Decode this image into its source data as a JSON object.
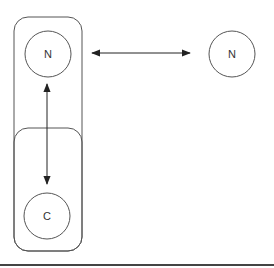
{
  "diagram": {
    "type": "graphical-model",
    "nodes": [
      {
        "id": "n-left",
        "label": "N",
        "group": "plate-outer"
      },
      {
        "id": "c",
        "label": "C",
        "group": "plate-inner"
      },
      {
        "id": "n-right",
        "label": "N",
        "group": null
      }
    ],
    "edges": [
      {
        "from": "n-left",
        "to": "n-right",
        "direction": "bidirectional"
      },
      {
        "from": "n-left",
        "to": "c",
        "direction": "bidirectional"
      }
    ],
    "colors": {
      "stroke": "#555555",
      "arrow": "#222222",
      "text": "#333333",
      "background": "#ffffff"
    }
  }
}
